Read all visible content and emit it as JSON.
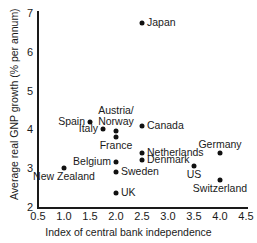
{
  "chart_data": {
    "type": "scatter",
    "title": "",
    "xlabel": "Index of central bank independence",
    "ylabel": "Average real GNP growth (% per annum)",
    "xlim": [
      0.5,
      4.5
    ],
    "ylim": [
      2,
      7
    ],
    "xticks": [
      "0.5",
      "1.0",
      "1.5",
      "2.0",
      "2.5",
      "3.0",
      "3.5",
      "4.0",
      "4.5"
    ],
    "yticks": [
      "2",
      "3",
      "4",
      "5",
      "6",
      "7"
    ],
    "grid": false,
    "legend": "none",
    "points": [
      {
        "label": "Japan",
        "x": 2.5,
        "y": 6.75,
        "label_pos": "right"
      },
      {
        "label": "Spain",
        "x": 1.5,
        "y": 4.2,
        "label_pos": "left"
      },
      {
        "label": "Canada",
        "x": 2.5,
        "y": 4.1,
        "label_pos": "right"
      },
      {
        "label": "Italy",
        "x": 1.75,
        "y": 4.0,
        "label_pos": "left"
      },
      {
        "label": "Austria/ Norway",
        "x": 2.0,
        "y": 3.95,
        "label_pos": "above"
      },
      {
        "label": "France",
        "x": 2.0,
        "y": 3.8,
        "label_pos": "below"
      },
      {
        "label": "Netherlands",
        "x": 2.5,
        "y": 3.4,
        "label_pos": "right"
      },
      {
        "label": "Germany",
        "x": 4.0,
        "y": 3.4,
        "label_pos": "above"
      },
      {
        "label": "Denmark",
        "x": 2.5,
        "y": 3.2,
        "label_pos": "right"
      },
      {
        "label": "Belgium",
        "x": 2.0,
        "y": 3.15,
        "label_pos": "left"
      },
      {
        "label": "US",
        "x": 3.5,
        "y": 3.05,
        "label_pos": "below"
      },
      {
        "label": "New Zealand",
        "x": 1.0,
        "y": 3.0,
        "label_pos": "below"
      },
      {
        "label": "Sweden",
        "x": 2.0,
        "y": 2.9,
        "label_pos": "right"
      },
      {
        "label": "Switzerland",
        "x": 4.0,
        "y": 2.7,
        "label_pos": "below"
      },
      {
        "label": "UK",
        "x": 2.0,
        "y": 2.35,
        "label_pos": "right"
      }
    ]
  },
  "colors": {
    "marker": "#111111",
    "axis": "#1a1a1a",
    "background": "#ffffff"
  }
}
